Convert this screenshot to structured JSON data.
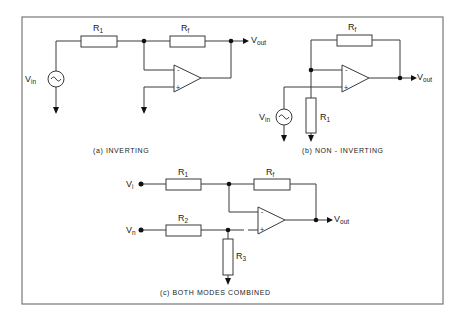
{
  "figure": {
    "frame_color": "#777777",
    "line_color": "#3a3a3a"
  },
  "circuit_a": {
    "caption": "(a) INVERTING",
    "input_label": "V",
    "input_sub": "in",
    "output_label": "V",
    "output_sub": "out",
    "r1_label": "R",
    "r1_sub": "1",
    "rf_label": "R",
    "rf_sub": "f",
    "minus": "-",
    "plus": "+"
  },
  "circuit_b": {
    "caption": "(b) NON - INVERTING",
    "input_label": "V",
    "input_sub": "in",
    "output_label": "V",
    "output_sub": "out",
    "r1_label": "R",
    "r1_sub": "1",
    "rf_label": "R",
    "rf_sub": "f",
    "minus": "-",
    "plus": "+"
  },
  "circuit_c": {
    "caption": "(c) BOTH MODES COMBINED",
    "input_i_label": "V",
    "input_i_sub": "i",
    "input_n_label": "V",
    "input_n_sub": "n",
    "output_label": "V",
    "output_sub": "out",
    "r1_label": "R",
    "r1_sub": "1",
    "r2_label": "R",
    "r2_sub": "2",
    "r3_label": "R",
    "r3_sub": "3",
    "rf_label": "R",
    "rf_sub": "f",
    "minus": "-",
    "plus": "+"
  }
}
